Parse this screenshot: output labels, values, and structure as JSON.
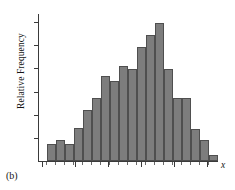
{
  "caption": {
    "panel_label": "(b)"
  },
  "axes": {
    "ylabel": "Relative Frequency",
    "xlabel": "x"
  },
  "chart_data": {
    "type": "bar",
    "title": "",
    "subtitle": "",
    "xlabel": "x",
    "ylabel": "Relative Frequency",
    "grid": false,
    "legend": null,
    "tick_labels": {
      "x": [],
      "y": []
    },
    "y_tick_count": 6,
    "x_major_tick_count": 6,
    "ylim": [
      0,
      1.0
    ],
    "xlim": [
      0,
      19
    ],
    "bar_count": 19,
    "categories": [
      "bin1",
      "bin2",
      "bin3",
      "bin4",
      "bin5",
      "bin6",
      "bin7",
      "bin8",
      "bin9",
      "bin10",
      "bin11",
      "bin12",
      "bin13",
      "bin14",
      "bin15",
      "bin16",
      "bin17",
      "bin18",
      "bin19"
    ],
    "values": [
      0.115,
      0.145,
      0.115,
      0.225,
      0.345,
      0.425,
      0.575,
      0.545,
      0.645,
      0.625,
      0.775,
      0.855,
      0.935,
      0.625,
      0.425,
      0.425,
      0.215,
      0.145,
      0.04
    ],
    "bar_pixel_layout": {
      "x_positions": [
        8,
        17,
        26,
        35,
        44,
        53,
        62,
        71,
        80,
        89,
        98,
        107,
        116,
        125,
        134,
        143,
        152,
        161,
        170
      ],
      "width": 9
    },
    "isolated_tail_bar_index": 18
  }
}
